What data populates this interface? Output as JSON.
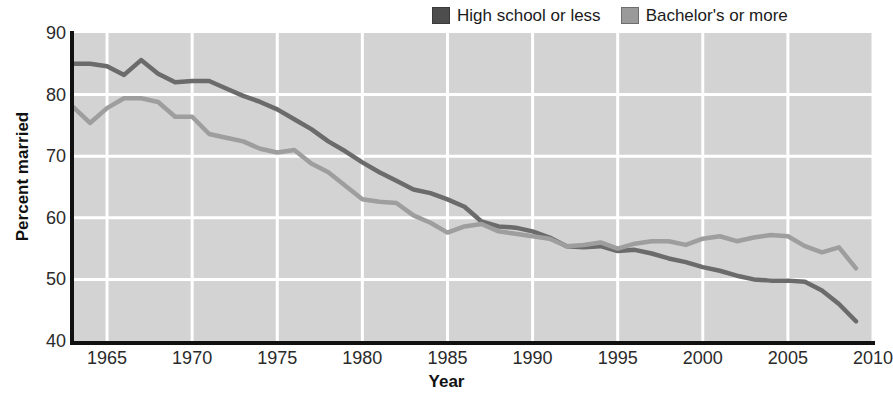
{
  "chart_data": {
    "type": "line",
    "title": "",
    "xlabel": "Year",
    "ylabel": "Percent married",
    "xlim": [
      1963,
      2010
    ],
    "ylim": [
      40,
      90
    ],
    "xticks": [
      1965,
      1970,
      1975,
      1980,
      1985,
      1990,
      1995,
      2000,
      2005,
      2010
    ],
    "yticks": [
      40,
      50,
      60,
      70,
      80,
      90
    ],
    "grid": true,
    "grid_color": "#ffffff",
    "plot_background": "#d3d3d3",
    "legend_position": "top-right",
    "x": [
      1963,
      1964,
      1965,
      1966,
      1967,
      1968,
      1969,
      1970,
      1971,
      1972,
      1973,
      1974,
      1975,
      1976,
      1977,
      1978,
      1979,
      1980,
      1981,
      1982,
      1983,
      1984,
      1985,
      1986,
      1987,
      1988,
      1989,
      1990,
      1991,
      1992,
      1993,
      1994,
      1995,
      1996,
      1997,
      1998,
      1999,
      2000,
      2001,
      2002,
      2003,
      2004,
      2005,
      2006,
      2007,
      2008,
      2009
    ],
    "series": [
      {
        "name": "High school or less",
        "color": "#6b6b6b",
        "values": [
          85.0,
          85.0,
          84.6,
          83.2,
          85.6,
          83.4,
          82.0,
          82.2,
          82.2,
          81.0,
          79.8,
          78.8,
          77.6,
          76.0,
          74.4,
          72.4,
          70.8,
          69.0,
          67.4,
          66.0,
          64.6,
          64.0,
          63.0,
          61.8,
          59.4,
          58.6,
          58.4,
          57.8,
          56.8,
          55.4,
          55.2,
          55.4,
          54.6,
          54.8,
          54.2,
          53.4,
          52.8,
          52.0,
          51.4,
          50.6,
          50.0,
          49.8,
          49.8,
          49.6,
          48.2,
          46.0,
          43.2
        ]
      },
      {
        "name": "Bachelor's or more",
        "color": "#9e9e9e",
        "values": [
          78.0,
          75.4,
          77.8,
          79.4,
          79.4,
          78.8,
          76.4,
          76.4,
          73.6,
          73.0,
          72.4,
          71.2,
          70.6,
          71.0,
          68.8,
          67.4,
          65.2,
          63.0,
          62.6,
          62.4,
          60.4,
          59.2,
          57.6,
          58.6,
          59.0,
          57.8,
          57.4,
          57.0,
          56.6,
          55.4,
          55.6,
          56.0,
          55.0,
          55.8,
          56.2,
          56.2,
          55.6,
          56.6,
          57.0,
          56.2,
          56.8,
          57.2,
          57.0,
          55.4,
          54.4,
          55.2,
          51.8
        ]
      }
    ]
  },
  "legend": {
    "entries": [
      {
        "label": "High school or less",
        "swatch_color": "#4d4d4d"
      },
      {
        "label": "Bachelor's or more",
        "swatch_color": "#9a9a9a"
      }
    ]
  }
}
